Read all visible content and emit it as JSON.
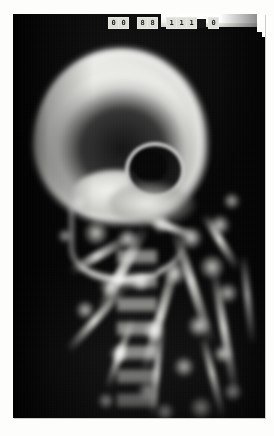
{
  "document": {
    "type": "radiograph",
    "modality": "X-ray",
    "view": "lateral skull",
    "subject": "infant / pediatric head and cervical spine",
    "background_color": "#fdfdfb",
    "film_color": "#050505"
  },
  "film": {
    "label_strip": {
      "description": "white exposure header strip with small character boxes burned into the top of the film",
      "exposure_block_color": "#ffffff",
      "character_groups": [
        {
          "name": "group-a",
          "cells": [
            "0",
            "0"
          ]
        },
        {
          "name": "group-b",
          "cells": [
            "8",
            "8"
          ]
        },
        {
          "name": "group-c",
          "cells": [
            "1",
            "1",
            "1"
          ]
        },
        {
          "name": "group-d",
          "cells": [
            "0"
          ]
        }
      ]
    },
    "corner_notch": {
      "position": "top-right",
      "description": "stepped cut corner of the film sheet"
    }
  },
  "anatomy": {
    "regions": [
      {
        "name": "cranial-vault",
        "label": "Cranial vault"
      },
      {
        "name": "orbit",
        "label": "Orbit"
      },
      {
        "name": "skull-base",
        "label": "Skull base / petrous bone"
      },
      {
        "name": "facial-bones",
        "label": "Facial bones / maxilla"
      },
      {
        "name": "mandible",
        "label": "Mandible"
      },
      {
        "name": "cervical-spine",
        "label": "Cervical spine"
      },
      {
        "name": "shoulder-girdle",
        "label": "Shoulder girdle / upper ribs"
      }
    ]
  },
  "streaks": [
    {
      "left": 62,
      "top": 250,
      "width": 96,
      "height": 10,
      "rotate": -62
    },
    {
      "left": 84,
      "top": 292,
      "width": 130,
      "height": 9,
      "rotate": -74
    },
    {
      "left": 40,
      "top": 300,
      "width": 88,
      "height": 8,
      "rotate": -48
    },
    {
      "left": 120,
      "top": 268,
      "width": 120,
      "height": 9,
      "rotate": 72
    },
    {
      "left": 146,
      "top": 316,
      "width": 132,
      "height": 8,
      "rotate": 80
    },
    {
      "left": 96,
      "top": 352,
      "width": 96,
      "height": 7,
      "rotate": -84
    },
    {
      "left": 158,
      "top": 360,
      "width": 84,
      "height": 7,
      "rotate": 76
    },
    {
      "left": 52,
      "top": 236,
      "width": 70,
      "height": 9,
      "rotate": -30
    },
    {
      "left": 176,
      "top": 224,
      "width": 64,
      "height": 8,
      "rotate": 58
    },
    {
      "left": 130,
      "top": 210,
      "width": 58,
      "height": 8,
      "rotate": 20
    },
    {
      "left": 190,
      "top": 282,
      "width": 90,
      "height": 7,
      "rotate": 84
    },
    {
      "left": 70,
      "top": 336,
      "width": 74,
      "height": 7,
      "rotate": -70
    }
  ],
  "spots": [
    {
      "left": 70,
      "top": 206,
      "size": 26
    },
    {
      "left": 104,
      "top": 214,
      "size": 22
    },
    {
      "left": 138,
      "top": 200,
      "size": 20
    },
    {
      "left": 166,
      "top": 212,
      "size": 24
    },
    {
      "left": 186,
      "top": 240,
      "size": 26
    },
    {
      "left": 196,
      "top": 200,
      "size": 22
    },
    {
      "left": 150,
      "top": 248,
      "size": 24
    },
    {
      "left": 118,
      "top": 258,
      "size": 20
    },
    {
      "left": 86,
      "top": 262,
      "size": 22
    },
    {
      "left": 62,
      "top": 286,
      "size": 20
    },
    {
      "left": 174,
      "top": 300,
      "size": 24
    },
    {
      "left": 204,
      "top": 268,
      "size": 22
    },
    {
      "left": 130,
      "top": 306,
      "size": 22
    },
    {
      "left": 96,
      "top": 330,
      "size": 20
    },
    {
      "left": 160,
      "top": 342,
      "size": 22
    },
    {
      "left": 200,
      "top": 330,
      "size": 20
    },
    {
      "left": 124,
      "top": 366,
      "size": 22
    },
    {
      "left": 176,
      "top": 382,
      "size": 24
    },
    {
      "left": 210,
      "top": 368,
      "size": 20
    },
    {
      "left": 84,
      "top": 378,
      "size": 18
    },
    {
      "left": 142,
      "top": 388,
      "size": 20
    },
    {
      "left": 56,
      "top": 180,
      "size": 18
    },
    {
      "left": 44,
      "top": 214,
      "size": 16
    },
    {
      "left": 210,
      "top": 178,
      "size": 18
    }
  ]
}
